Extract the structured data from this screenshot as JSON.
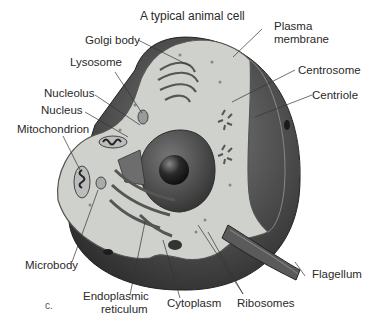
{
  "diagram": {
    "title": "A typical animal cell",
    "panel_letter": "c.",
    "colors": {
      "membrane_outer": "#3a3a3a",
      "membrane_mid": "#6a6a6a",
      "cytoplasm": "#cfd1cc",
      "nucleus": "#4a4a4a",
      "nucleolus": "#1e1e1e",
      "organelle": "#8a8a8a",
      "leader_line": "#333333"
    },
    "labels": {
      "golgi_body": "Golgi body",
      "plasma_membrane_line1": "Plasma",
      "plasma_membrane_line2": "membrane",
      "lysosome": "Lysosome",
      "centrosome": "Centrosome",
      "nucleolus": "Nucleolus",
      "centriole": "Centriole",
      "nucleus": "Nucleus",
      "mitochondrion": "Mitochondrion",
      "microbody": "Microbody",
      "flagellum": "Flagellum",
      "endoplasmic_reticulum_line1": "Endoplasmic",
      "endoplasmic_reticulum_line2": "reticulum",
      "cytoplasm": "Cytoplasm",
      "ribosomes": "Ribosomes"
    }
  }
}
